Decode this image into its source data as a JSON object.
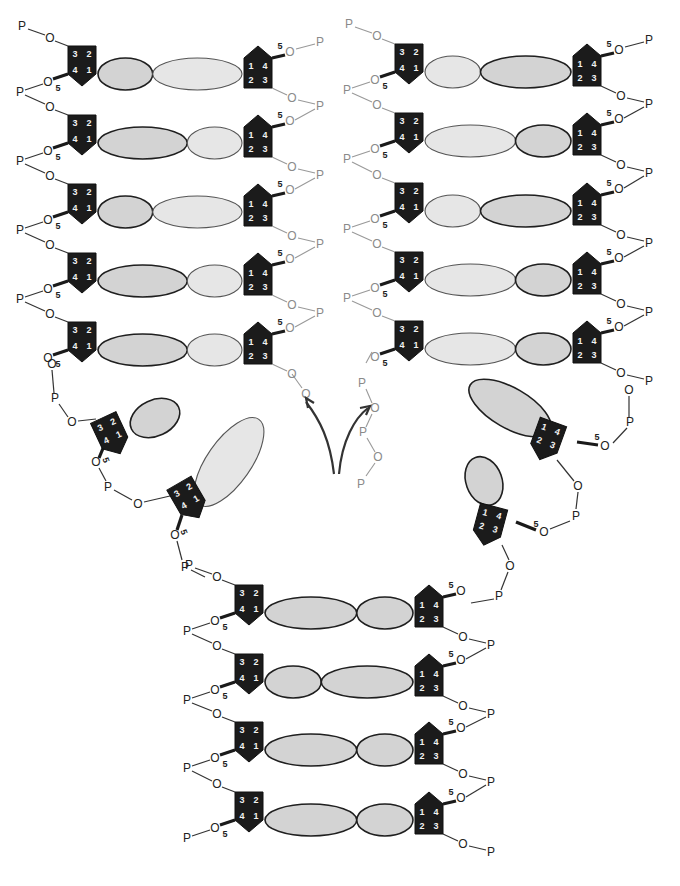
{
  "diagram": {
    "labels": {
      "phosphate": "P",
      "oxygen": "O",
      "carbon_5_prime": "5",
      "sugar_carbons": [
        "1",
        "2",
        "3",
        "4"
      ]
    },
    "regions": [
      {
        "name": "upper-left-duplex",
        "base_pairs": 5
      },
      {
        "name": "upper-right-duplex",
        "base_pairs": 5
      },
      {
        "name": "lower-parent-duplex",
        "base_pairs": 4
      },
      {
        "name": "left-unpaired-nucleotides",
        "count": 2
      },
      {
        "name": "right-unpaired-nucleotides",
        "count": 2
      }
    ],
    "arrows": {
      "count": 2,
      "meaning": "new strand attachment direction"
    },
    "colors": {
      "sugar": "#1b1b1b",
      "base_dark_fill": "#d3d3d3",
      "base_light_fill": "#e6e6e6",
      "old_strand_text": "#222222",
      "new_strand_text": "#8a8a8a"
    }
  }
}
